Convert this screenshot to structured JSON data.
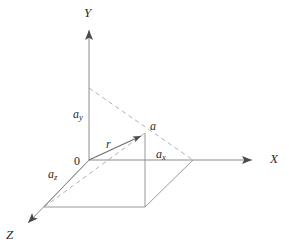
{
  "figure": {
    "kind": "3d-cartesian-vector-diagram",
    "background_color": "#ffffff",
    "line_color": "#8c8c8c",
    "dash_color": "#a6a6a6",
    "text_color": "#2b2b2b"
  },
  "axes": {
    "y": {
      "label": "Y",
      "direction": "up"
    },
    "x": {
      "label": "X",
      "direction": "right"
    },
    "z": {
      "label": "Z",
      "direction": "down-left"
    }
  },
  "origin": {
    "label": "0"
  },
  "point": {
    "label": "a"
  },
  "vector": {
    "label": "r"
  },
  "components": {
    "x": {
      "base": "a",
      "sub": "x"
    },
    "y": {
      "base": "a",
      "sub": "y"
    },
    "z": {
      "base": "a",
      "sub": "z"
    }
  },
  "geometry": {
    "origin_px": [
      89,
      160
    ],
    "point_a_px": [
      145,
      133
    ],
    "x_axis_end_px": [
      258,
      160
    ],
    "y_axis_end_px": [
      89,
      22
    ],
    "z_axis_end_px": [
      22,
      228
    ],
    "base_parallelogram_px": [
      [
        89,
        160
      ],
      [
        193,
        160
      ],
      [
        145,
        207
      ],
      [
        44,
        207
      ]
    ],
    "dashed_y_to_x_px": [
      [
        89,
        88
      ],
      [
        193,
        160
      ]
    ],
    "dashed_z_to_a_px": [
      [
        44,
        207
      ],
      [
        145,
        133
      ]
    ]
  }
}
